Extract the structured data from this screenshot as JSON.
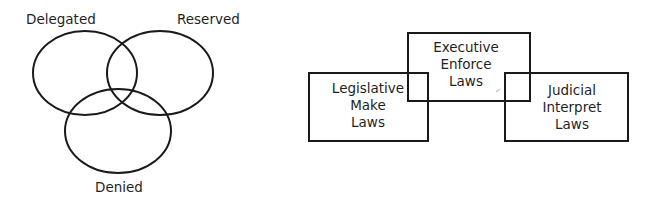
{
  "venn": {
    "circles": [
      {
        "label": "Delegated",
        "cx": 85,
        "cy": 73,
        "rx": 52,
        "ry": 42
      },
      {
        "label": "Reserved",
        "cx": 160,
        "cy": 73,
        "rx": 53,
        "ry": 42
      },
      {
        "label": "Denied",
        "cx": 118,
        "cy": 131,
        "rx": 53,
        "ry": 42
      }
    ],
    "stroke_color": "#1a1a1a"
  },
  "branches": {
    "legislative": {
      "line1": "Legislative",
      "line2": "Make",
      "line3": "Laws"
    },
    "executive": {
      "line1": "Executive",
      "line2": "Enforce",
      "line3": "Laws"
    },
    "judicial": {
      "line1": "Judicial",
      "line2": "Interpret",
      "line3": "Laws"
    },
    "stroke_color": "#1a1a1a"
  }
}
